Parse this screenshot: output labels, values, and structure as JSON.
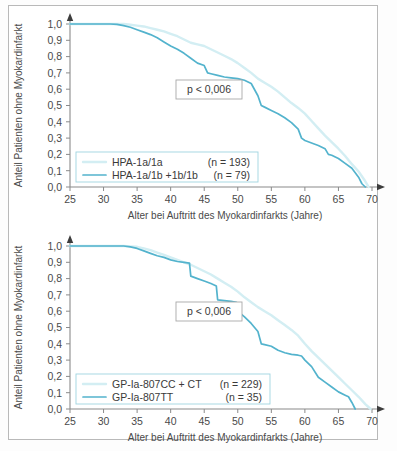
{
  "figure": {
    "background_color": "#ffffff",
    "frame_color": "#b9b9b9",
    "axis_color": "#8a8a8a",
    "text_color": "#4a4a4a"
  },
  "colors": {
    "series_light": "#d3eef3",
    "series_dark": "#53b3cd",
    "legend_border": "#9fd4e0",
    "annotation_border": "#a8a8a8"
  },
  "axes": {
    "x_label": "Alter bei Auftritt des Myokardinfarkts (Jahre)",
    "y_label": "Anteil Patienten ohne Myokardinfarkt",
    "x_ticks": [
      "25",
      "30",
      "35",
      "40",
      "45",
      "50",
      "55",
      "60",
      "65",
      "70"
    ],
    "y_ticks": [
      "1,0",
      "0,9",
      "0,8",
      "0,7",
      "0,6",
      "0,5",
      "0,4",
      "0,3",
      "0,2",
      "0,1",
      "0,0"
    ]
  },
  "chart_data": [
    {
      "type": "line",
      "id": "top-panel",
      "title": "",
      "xlabel": "Alter bei Auftritt des Myokardinfarkts (Jahre)",
      "ylabel": "Anteil Patienten ohne Myokardinfarkt",
      "xlim": [
        25,
        70
      ],
      "ylim": [
        0.0,
        1.0
      ],
      "xticks": [
        25,
        30,
        35,
        40,
        45,
        50,
        55,
        60,
        65,
        70
      ],
      "yticks": [
        0.0,
        0.1,
        0.2,
        0.3,
        0.4,
        0.5,
        0.6,
        0.7,
        0.8,
        0.9,
        1.0
      ],
      "grid": false,
      "legend_position": "lower-left",
      "annotation": "p < 0,006",
      "series": [
        {
          "name": "HPA-1a/1a",
          "n_label": "(n = 193)",
          "color": "#d3eef3",
          "x": [
            25,
            28,
            31,
            33,
            34,
            35,
            36,
            37,
            38,
            39,
            40,
            41,
            42,
            43,
            44,
            45,
            46,
            47,
            48,
            49,
            50,
            51,
            52,
            53,
            54,
            55,
            56,
            57,
            58,
            59,
            60,
            61,
            62,
            63,
            64,
            65,
            66,
            67,
            68,
            69,
            69.5
          ],
          "y": [
            1.0,
            1.0,
            1.0,
            1.0,
            0.995,
            0.99,
            0.985,
            0.975,
            0.965,
            0.955,
            0.94,
            0.925,
            0.905,
            0.885,
            0.875,
            0.865,
            0.845,
            0.825,
            0.805,
            0.785,
            0.76,
            0.73,
            0.7,
            0.665,
            0.64,
            0.615,
            0.585,
            0.55,
            0.515,
            0.485,
            0.45,
            0.405,
            0.36,
            0.315,
            0.275,
            0.235,
            0.19,
            0.14,
            0.095,
            0.035,
            0.0
          ]
        },
        {
          "name": "HPA-1a/1b +1b/1b",
          "n_label": "(n = 79)",
          "color": "#53b3cd",
          "x": [
            25,
            28,
            31,
            32,
            33,
            34,
            35,
            36,
            37,
            38,
            39,
            40,
            41,
            42,
            43,
            44,
            45,
            45.5,
            46,
            47,
            48,
            49,
            50,
            51,
            52,
            53,
            53.5,
            54,
            55,
            56,
            57,
            58,
            59,
            59.5,
            60,
            61,
            62,
            63,
            63.5,
            64,
            65,
            66,
            67,
            68,
            68.5,
            69
          ],
          "y": [
            1.0,
            1.0,
            1.0,
            0.998,
            0.99,
            0.98,
            0.965,
            0.95,
            0.935,
            0.915,
            0.89,
            0.865,
            0.845,
            0.82,
            0.79,
            0.76,
            0.745,
            0.7,
            0.695,
            0.685,
            0.675,
            0.67,
            0.665,
            0.655,
            0.635,
            0.56,
            0.5,
            0.49,
            0.47,
            0.45,
            0.425,
            0.395,
            0.355,
            0.3,
            0.285,
            0.27,
            0.255,
            0.235,
            0.2,
            0.195,
            0.175,
            0.145,
            0.115,
            0.06,
            0.02,
            0.0
          ]
        }
      ]
    },
    {
      "type": "line",
      "id": "bottom-panel",
      "title": "",
      "xlabel": "Alter bei Auftritt des Myokardinfarkts (Jahre)",
      "ylabel": "Anteil Patienten ohne Myokardinfarkt",
      "xlim": [
        25,
        70
      ],
      "ylim": [
        0.0,
        1.0
      ],
      "xticks": [
        25,
        30,
        35,
        40,
        45,
        50,
        55,
        60,
        65,
        70
      ],
      "yticks": [
        0.0,
        0.1,
        0.2,
        0.3,
        0.4,
        0.5,
        0.6,
        0.7,
        0.8,
        0.9,
        1.0
      ],
      "grid": false,
      "legend_position": "lower-left",
      "annotation": "p < 0,006",
      "series": [
        {
          "name": "GP-Ia-807CC + CT",
          "n_label": "(n = 229)",
          "color": "#d3eef3",
          "x": [
            25,
            29,
            32,
            33,
            34,
            35,
            36,
            37,
            38,
            39,
            40,
            41,
            42,
            43,
            44,
            45,
            46,
            47,
            48,
            49,
            50,
            51,
            52,
            53,
            54,
            55,
            56,
            57,
            58,
            59,
            60,
            61,
            62,
            63,
            64,
            65,
            66,
            67,
            68,
            69,
            69.8
          ],
          "y": [
            1.0,
            1.0,
            1.0,
            1.0,
            0.998,
            0.995,
            0.985,
            0.975,
            0.96,
            0.945,
            0.93,
            0.915,
            0.9,
            0.885,
            0.865,
            0.845,
            0.825,
            0.8,
            0.775,
            0.75,
            0.72,
            0.685,
            0.655,
            0.625,
            0.6,
            0.575,
            0.545,
            0.515,
            0.485,
            0.45,
            0.4,
            0.355,
            0.315,
            0.275,
            0.235,
            0.195,
            0.155,
            0.115,
            0.075,
            0.03,
            0.0
          ]
        },
        {
          "name": "GP-Ia-807TT",
          "n_label": "(n = 35)",
          "color": "#53b3cd",
          "x": [
            25,
            29,
            32,
            33,
            34,
            35,
            36,
            37,
            38,
            39,
            40,
            41,
            42,
            42.8,
            43,
            44,
            45,
            46,
            46.8,
            47,
            48,
            49,
            49.8,
            50,
            51,
            52,
            53,
            53.5,
            54,
            55,
            56,
            57,
            58,
            59,
            59.5,
            60,
            61,
            62,
            63,
            64,
            65,
            66,
            66.5,
            67,
            67.5
          ],
          "y": [
            1.0,
            1.0,
            1.0,
            1.0,
            0.995,
            0.985,
            0.97,
            0.955,
            0.94,
            0.93,
            0.915,
            0.905,
            0.9,
            0.895,
            0.815,
            0.8,
            0.785,
            0.77,
            0.755,
            0.67,
            0.665,
            0.66,
            0.655,
            0.6,
            0.565,
            0.525,
            0.475,
            0.4,
            0.395,
            0.385,
            0.36,
            0.345,
            0.335,
            0.33,
            0.325,
            0.3,
            0.26,
            0.195,
            0.165,
            0.135,
            0.105,
            0.085,
            0.075,
            0.04,
            0.0
          ]
        }
      ]
    }
  ]
}
